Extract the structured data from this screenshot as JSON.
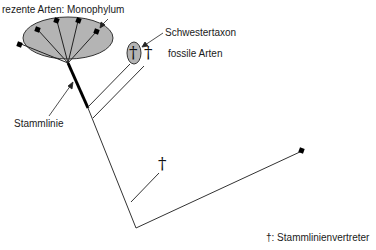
{
  "diagram": {
    "labels": {
      "monophylum": "rezente Arten: Monophylum",
      "sister_taxon": "Schwestertaxon",
      "fossil_species": "fossile Arten",
      "stem_line": "Stammlinie",
      "legend": "†: Stammlinienvertreter"
    },
    "symbols": {
      "dagger": "†"
    },
    "colors": {
      "ellipse_fill": "#b4b4b4",
      "line": "#333333",
      "stem_line": "#000000"
    }
  }
}
